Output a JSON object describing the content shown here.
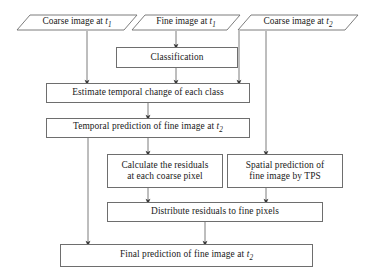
{
  "diagram": {
    "type": "flowchart",
    "orientation": "top-to-bottom",
    "stroke_color": "#6e6e6e",
    "arrow_color": "#3a3a3a",
    "text_color": "#1a1a1a",
    "background_color": "#ffffff",
    "nodes": [
      {
        "id": "coarse_t1",
        "shape": "parallelogram",
        "role": "input",
        "label": "Coarse image at t1",
        "text_main": "Coarse image at ",
        "text_var": "t",
        "text_sub": "1"
      },
      {
        "id": "fine_t1",
        "shape": "parallelogram",
        "role": "input",
        "label": "Fine image at t1",
        "text_main": "Fine image at ",
        "text_var": "t",
        "text_sub": "1"
      },
      {
        "id": "coarse_t2",
        "shape": "parallelogram",
        "role": "input",
        "label": "Coarse image at t2",
        "text_main": "Coarse image at ",
        "text_var": "t",
        "text_sub": "2"
      },
      {
        "id": "classification",
        "shape": "rectangle",
        "role": "process",
        "label": "Classification"
      },
      {
        "id": "estimate_change",
        "shape": "rectangle",
        "role": "process",
        "label": "Estimate temporal change of each class"
      },
      {
        "id": "temporal_prediction",
        "shape": "rectangle",
        "role": "process",
        "label": "Temporal prediction of fine image at t2",
        "text_main": "Temporal prediction of fine image at ",
        "text_var": "t",
        "text_sub": "2"
      },
      {
        "id": "calculate_residuals",
        "shape": "rectangle",
        "role": "process",
        "label": "Calculate the residuals\nat each coarse pixel"
      },
      {
        "id": "spatial_prediction",
        "shape": "rectangle",
        "role": "process",
        "label": "Spatial prediction of\nfine image by TPS"
      },
      {
        "id": "distribute_residuals",
        "shape": "rectangle",
        "role": "process",
        "label": "Distribute residuals to fine pixels"
      },
      {
        "id": "final_prediction",
        "shape": "rectangle",
        "role": "output",
        "label": "Final prediction of fine image at t2",
        "text_main": "Final prediction of fine image at ",
        "text_var": "t",
        "text_sub": "2"
      }
    ],
    "edges": [
      {
        "from": "coarse_t1",
        "to": "estimate_change"
      },
      {
        "from": "fine_t1",
        "to": "classification"
      },
      {
        "from": "classification",
        "to": "estimate_change"
      },
      {
        "from": "coarse_t2",
        "to": "estimate_change"
      },
      {
        "from": "coarse_t2",
        "to": "spatial_prediction"
      },
      {
        "from": "estimate_change",
        "to": "temporal_prediction"
      },
      {
        "from": "temporal_prediction",
        "to": "calculate_residuals"
      },
      {
        "from": "temporal_prediction",
        "to": "final_prediction"
      },
      {
        "from": "calculate_residuals",
        "to": "distribute_residuals"
      },
      {
        "from": "spatial_prediction",
        "to": "distribute_residuals"
      },
      {
        "from": "distribute_residuals",
        "to": "final_prediction"
      }
    ]
  }
}
